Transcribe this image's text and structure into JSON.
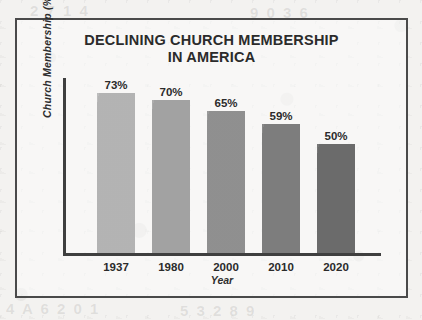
{
  "chart_data": {
    "type": "bar",
    "title": "DECLINING CHURCH MEMBERSHIP IN AMERICA",
    "title_line1": "DECLINING CHURCH MEMBERSHIP",
    "title_line2": "IN AMERICA",
    "xlabel": "Year",
    "ylabel": "Church Membership (%)",
    "categories": [
      "1937",
      "1980",
      "2000",
      "2010",
      "2020"
    ],
    "values": [
      73,
      70,
      65,
      59,
      50
    ],
    "data_labels": [
      "73%",
      "70%",
      "65%",
      "59%",
      "50%"
    ],
    "bar_colors": [
      "#b9b9b9",
      "#a7a7a7",
      "#949494",
      "#818181",
      "#6e6e6e"
    ],
    "ylim": [
      0,
      80
    ],
    "grid": false,
    "legend": null,
    "axis_color": "#3f3f3f",
    "text_color": "#2b2b2b",
    "frame_color": "#4a4a4a",
    "background_color": "#f3f2f0"
  },
  "bleed_through": {
    "a": "4 A 6 2 0 1",
    "b": "5 3 2 8 9",
    "c": "2 7 1 4",
    "d": "9 0 3 6"
  }
}
